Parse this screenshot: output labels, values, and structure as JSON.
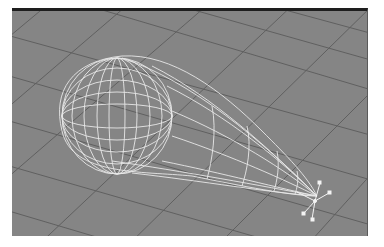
{
  "viewport": {
    "mode": "wireframe",
    "object": "teardrop-mesh",
    "background_color": "#858585",
    "grid_color": "#5f5f5f",
    "wire_color": "#f2f2f2"
  }
}
